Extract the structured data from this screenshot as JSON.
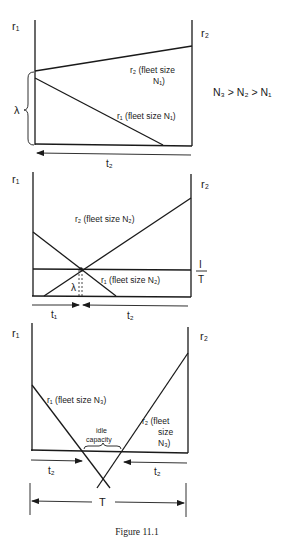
{
  "figure": {
    "caption": "Figure 11.1",
    "relation": "N₃ > N₂ > N₁",
    "colors": {
      "ink": "#1a1a1a",
      "background": "#ffffff"
    }
  },
  "panel1": {
    "axis_left": "r₁",
    "axis_right": "r₂",
    "brace_label": "λ",
    "r2_label_line1": "r₂ (fleet size",
    "r2_label_line2": "N₁)",
    "r1_label": "r₁ (fleet size N₁)",
    "arrow_label": "t₂"
  },
  "panel2": {
    "axis_left": "r₁",
    "axis_right": "r₂",
    "r2_label": "r₂ (fleet size N₂)",
    "r1_label": "r₁ (fleet size N₂)",
    "lambda_label": "λ",
    "fraction_num": "I",
    "fraction_den": "T",
    "t1_label": "t₁",
    "t2_label": "t₂"
  },
  "panel3": {
    "axis_left": "r₁",
    "axis_right": "r₂",
    "r1_label": "r₁ (fleet size N₃)",
    "r2_label_line1": "r₂ (fleet",
    "r2_label_line2": "size",
    "r2_label_line3": "N₃)",
    "idle_line1": "idle",
    "idle_line2": "capacity",
    "t2_left_label": "t₂",
    "t2_right_label": "t₂",
    "total_label": "T"
  }
}
